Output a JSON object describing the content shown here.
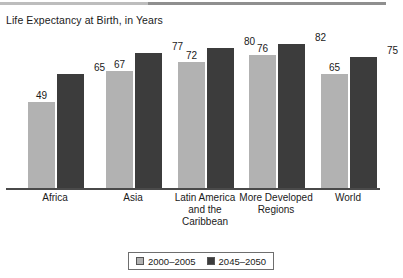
{
  "chart_data": {
    "type": "bar",
    "title": "Life Expectancy at Birth, in Years",
    "xlabel": "",
    "ylabel": "",
    "ylim": [
      0,
      90
    ],
    "grid": false,
    "legend_position": "bottom",
    "categories": [
      "Africa",
      "Asia",
      "Latin America\nand the\nCaribbean",
      "More Developed\nRegions",
      "World"
    ],
    "series": [
      {
        "name": "2000–2005",
        "color": "#b2b2b2",
        "values": [
          49,
          67,
          72,
          76,
          65
        ]
      },
      {
        "name": "2045–2050",
        "color": "#3c3c3c",
        "values": [
          65,
          77,
          80,
          82,
          75
        ]
      }
    ]
  },
  "legend": {
    "entries": [
      {
        "label": "2000–2005"
      },
      {
        "label": "2045–2050"
      }
    ]
  }
}
